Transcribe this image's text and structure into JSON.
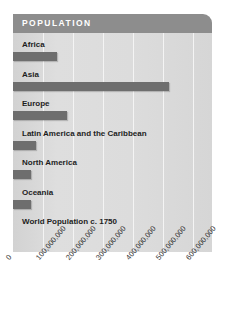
{
  "header": {
    "title": "POPULATION"
  },
  "footer": {
    "note": "World Population c. 1750"
  },
  "colors": {
    "header_band": "#8d8d8d",
    "plot_background": "#dcdcdc",
    "bar": "#6e6e6e",
    "gridline": "#f4f4f4",
    "label_text": "#1d1d1d",
    "header_text": "#ffffff",
    "tick_text": "#3a3a3a"
  },
  "axis": {
    "ticks": [
      "0",
      "100,000,000",
      "200,000,000",
      "300,000,000",
      "400,000,000",
      "500,000,000",
      "600,000,000"
    ]
  },
  "chart_data": {
    "type": "bar",
    "orientation": "horizontal",
    "title": "POPULATION",
    "subtitle": "World Population c. 1750",
    "xlabel": "",
    "ylabel": "",
    "xlim": [
      0,
      650000000
    ],
    "grid": true,
    "legend": "none",
    "categories": [
      "Africa",
      "Asia",
      "Europe",
      "Latin America and the Caribbean",
      "North America",
      "Oceania"
    ],
    "values": [
      147000000,
      520000000,
      180000000,
      75000000,
      60000000,
      60000000
    ],
    "tick_values": [
      0,
      100000000,
      200000000,
      300000000,
      400000000,
      500000000,
      600000000
    ],
    "tick_labels": [
      "0",
      "100,000,000",
      "200,000,000",
      "300,000,000",
      "400,000,000",
      "500,000,000",
      "600,000,000"
    ]
  }
}
